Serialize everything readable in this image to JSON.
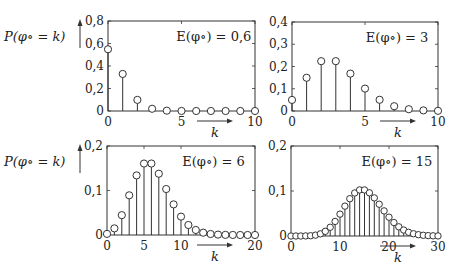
{
  "chart_data": [
    {
      "type": "stem",
      "title": "E(φ∘) = 0,6",
      "annotation": "E(φ∘) = 0,6",
      "xlabel": "k",
      "ylabel": "P(φ∘ = k)",
      "xlim": [
        0,
        10
      ],
      "ylim": [
        0,
        0.8
      ],
      "xticks": [
        0,
        5,
        10
      ],
      "xtick_labels": [
        "0",
        "5",
        "10"
      ],
      "yticks": [
        0,
        0.2,
        0.4,
        0.6,
        0.8
      ],
      "ytick_labels": [
        "0",
        "0,2",
        "0,4",
        "0,6",
        "0,8"
      ],
      "x": [
        0,
        1,
        2,
        3,
        4,
        5,
        6,
        7,
        8,
        9,
        10
      ],
      "values": [
        0.5488,
        0.3293,
        0.0988,
        0.0198,
        0.003,
        0.0004,
        0.0,
        0.0,
        0.0,
        0.0,
        0.0
      ],
      "box": {
        "left": 108,
        "top": 21,
        "right": 255,
        "bottom": 111
      },
      "show_ylabel": true,
      "grid": false
    },
    {
      "type": "stem",
      "title": "E(φ∘) = 3",
      "annotation": "E(φ∘) = 3",
      "xlabel": "k",
      "ylabel": "",
      "xlim": [
        0,
        10
      ],
      "ylim": [
        0,
        0.4
      ],
      "xticks": [
        0,
        5,
        10
      ],
      "xtick_labels": [
        "0",
        "5",
        "10"
      ],
      "yticks": [
        0,
        0.1,
        0.2,
        0.3,
        0.4
      ],
      "ytick_labels": [
        "0",
        "0,1",
        "0,2",
        "0,3",
        "0,4"
      ],
      "x": [
        0,
        1,
        2,
        3,
        4,
        5,
        6,
        7,
        8,
        9,
        10
      ],
      "values": [
        0.0498,
        0.1494,
        0.224,
        0.224,
        0.168,
        0.1008,
        0.0504,
        0.0216,
        0.0081,
        0.0027,
        0.0008
      ],
      "box": {
        "left": 292,
        "top": 22,
        "right": 438,
        "bottom": 111
      },
      "show_ylabel": false,
      "grid": false
    },
    {
      "type": "stem",
      "title": "E(φ∘) = 6",
      "annotation": "E(φ∘) = 6",
      "xlabel": "k",
      "ylabel": "P(φ∘ = k)",
      "xlim": [
        0,
        20
      ],
      "ylim": [
        0,
        0.2
      ],
      "xticks": [
        0,
        5,
        10,
        20
      ],
      "xtick_labels": [
        "0",
        "5",
        "10",
        "20"
      ],
      "yticks": [
        0,
        0.1,
        0.2
      ],
      "ytick_labels": [
        "0",
        "0,1",
        "0,2"
      ],
      "x": [
        0,
        1,
        2,
        3,
        4,
        5,
        6,
        7,
        8,
        9,
        10,
        11,
        12,
        13,
        14,
        15,
        16,
        17,
        18,
        19,
        20
      ],
      "values": [
        0.0025,
        0.0149,
        0.0446,
        0.0892,
        0.1339,
        0.1606,
        0.1606,
        0.1377,
        0.1033,
        0.0688,
        0.0413,
        0.0225,
        0.0113,
        0.0052,
        0.0022,
        0.0009,
        0.0003,
        0.0001,
        0.0,
        0.0,
        0.0
      ],
      "box": {
        "left": 107,
        "top": 146,
        "right": 255,
        "bottom": 235
      },
      "show_ylabel": true,
      "grid": false
    },
    {
      "type": "stem",
      "title": "E(φ∘) = 15",
      "annotation": "E(φ∘) = 15",
      "xlabel": "k",
      "ylabel": "",
      "xlim": [
        0,
        30
      ],
      "ylim": [
        0,
        0.2
      ],
      "xticks": [
        0,
        10,
        20,
        30
      ],
      "xtick_labels": [
        "0",
        "10",
        "20",
        "30"
      ],
      "yticks": [
        0,
        0.1,
        0.2
      ],
      "ytick_labels": [
        "0",
        "0,1",
        "0,2"
      ],
      "x": [
        0,
        1,
        2,
        3,
        4,
        5,
        6,
        7,
        8,
        9,
        10,
        11,
        12,
        13,
        14,
        15,
        16,
        17,
        18,
        19,
        20,
        21,
        22,
        23,
        24,
        25,
        26,
        27,
        28,
        29,
        30
      ],
      "values": [
        0.0,
        0.0,
        0.0,
        0.0002,
        0.0006,
        0.0019,
        0.0048,
        0.0104,
        0.0194,
        0.0324,
        0.0486,
        0.0663,
        0.0829,
        0.0956,
        0.1024,
        0.1024,
        0.096,
        0.0847,
        0.0706,
        0.0558,
        0.0418,
        0.0299,
        0.0204,
        0.0133,
        0.0083,
        0.005,
        0.0029,
        0.0016,
        0.0009,
        0.0004,
        0.0002
      ],
      "box": {
        "left": 291,
        "top": 146,
        "right": 438,
        "bottom": 236
      },
      "show_ylabel": false,
      "grid": false
    }
  ]
}
